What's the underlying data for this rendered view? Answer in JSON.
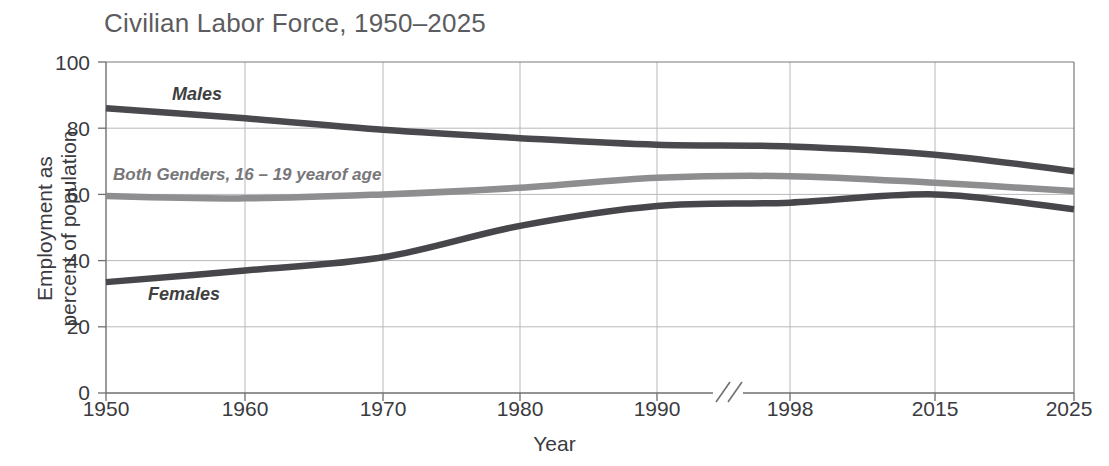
{
  "chart_data": {
    "type": "line",
    "title": "Civilian Labor Force, 1950–2025",
    "xlabel": "Year",
    "ylabel_line1": "Employment as",
    "ylabel_line2": "percent of population",
    "ylim": [
      0,
      100
    ],
    "yticks": [
      0,
      20,
      40,
      60,
      80,
      100
    ],
    "ytick_labels": [
      "0",
      "20",
      "40",
      "60",
      "80",
      "100"
    ],
    "xticks": [
      1950,
      1960,
      1970,
      1980,
      1990,
      1998,
      2015,
      2025
    ],
    "xtick_labels": [
      "1950",
      "1960",
      "1970",
      "1980",
      "1990",
      "1998",
      "2015",
      "2025"
    ],
    "axis_break": {
      "present": true,
      "symbol": "//",
      "between": [
        "1990",
        "1998"
      ]
    },
    "grid": true,
    "legend": "inline-labels",
    "x": [
      1950,
      1960,
      1970,
      1980,
      1990,
      1998,
      2015,
      2025
    ],
    "series": [
      {
        "name": "Males",
        "color": "#4a4a4e",
        "values": [
          86.0,
          83.0,
          79.5,
          77.0,
          75.0,
          74.5,
          72.0,
          67.0
        ]
      },
      {
        "name": "Both Genders, 16 – 19 yearof age",
        "color": "#8e8e91",
        "values": [
          59.5,
          58.8,
          60.0,
          62.0,
          65.0,
          65.5,
          63.5,
          61.0
        ]
      },
      {
        "name": "Females",
        "color": "#47474b",
        "values": [
          33.5,
          37.0,
          41.0,
          50.5,
          56.5,
          57.5,
          60.0,
          55.5
        ]
      }
    ]
  },
  "labels": {
    "males": "Males",
    "females": "Females",
    "both_genders": "Both Genders, 16 – 19 yearof age"
  },
  "colors": {
    "title": "#5c5c60",
    "axis_text": "#3b3b3f",
    "grid": "#b9b9bd",
    "axis_line": "#6f6f73",
    "males": "#4a4a4e",
    "females": "#47474b",
    "both": "#8e8e91",
    "background": "#ffffff"
  }
}
